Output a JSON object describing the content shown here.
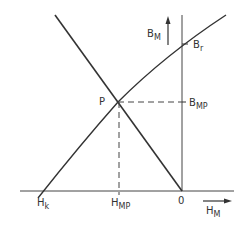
{
  "diagram": {
    "type": "magnet-demagnetization-curve",
    "labels": {
      "b_axis": {
        "main": "B",
        "sub": "M"
      },
      "h_axis": {
        "main": "H",
        "sub": "M"
      },
      "remanence": {
        "main": "B",
        "sub": "r"
      },
      "b_operating": {
        "main": "B",
        "sub": "MP"
      },
      "h_operating": {
        "main": "H",
        "sub": "MP"
      },
      "coercivity": {
        "main": "H",
        "sub": "k"
      },
      "origin": "0",
      "point": "P"
    },
    "colors": {
      "line": "#333333",
      "background": "#ffffff"
    }
  }
}
